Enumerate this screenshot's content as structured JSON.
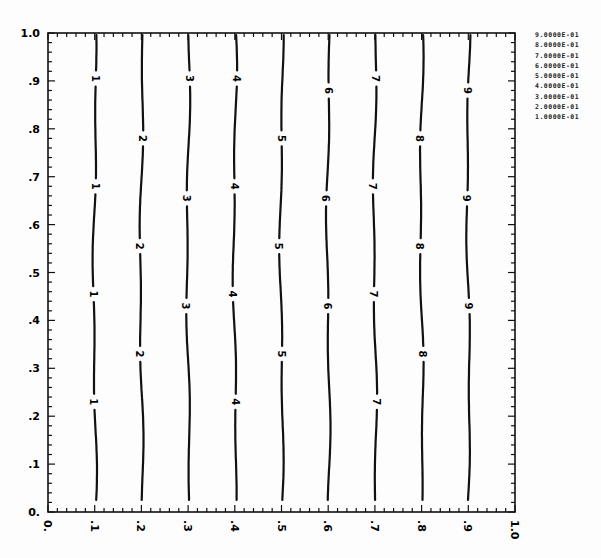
{
  "chart_data": {
    "type": "contour",
    "title": "",
    "xlabel": "",
    "ylabel": "",
    "xlim": [
      0,
      1.0
    ],
    "ylim": [
      0,
      1.0
    ],
    "grid": false,
    "legend_position": "right",
    "x_tick_labels": [
      "0.",
      ".1",
      ".2",
      ".3",
      ".4",
      ".5",
      ".6",
      ".7",
      ".8",
      ".9",
      "1.0"
    ],
    "y_tick_labels": [
      "0.",
      ".1",
      ".2",
      ".3",
      ".4",
      ".5",
      ".6",
      ".7",
      ".8",
      ".9",
      "1.0"
    ],
    "legend": [
      "9.0000E-01",
      "8.0000E-01",
      "7.0000E-01",
      "6.0000E-01",
      "5.0000E-01",
      "4.0000E-01",
      "3.0000E-01",
      "2.0000E-01",
      "1.0000E-01"
    ],
    "contours": [
      {
        "level": 0.1,
        "label": "1",
        "x": 0.1,
        "label_y": [
          0.905,
          0.68,
          0.455,
          0.23
        ]
      },
      {
        "level": 0.2,
        "label": "2",
        "x": 0.2,
        "label_y": [
          0.78,
          0.555,
          0.33
        ]
      },
      {
        "level": 0.3,
        "label": "3",
        "x": 0.3,
        "label_y": [
          0.905,
          0.655,
          0.43
        ]
      },
      {
        "level": 0.4,
        "label": "4",
        "x": 0.4,
        "label_y": [
          0.905,
          0.68,
          0.455,
          0.23
        ]
      },
      {
        "level": 0.5,
        "label": "5",
        "x": 0.5,
        "label_y": [
          0.78,
          0.555,
          0.33
        ]
      },
      {
        "level": 0.6,
        "label": "6",
        "x": 0.6,
        "label_y": [
          0.88,
          0.655,
          0.43
        ]
      },
      {
        "level": 0.7,
        "label": "7",
        "x": 0.7,
        "label_y": [
          0.905,
          0.68,
          0.455,
          0.23
        ]
      },
      {
        "level": 0.8,
        "label": "8",
        "x": 0.8,
        "label_y": [
          0.78,
          0.555,
          0.33
        ]
      },
      {
        "level": 0.9,
        "label": "9",
        "x": 0.9,
        "label_y": [
          0.88,
          0.655,
          0.43
        ]
      }
    ]
  }
}
